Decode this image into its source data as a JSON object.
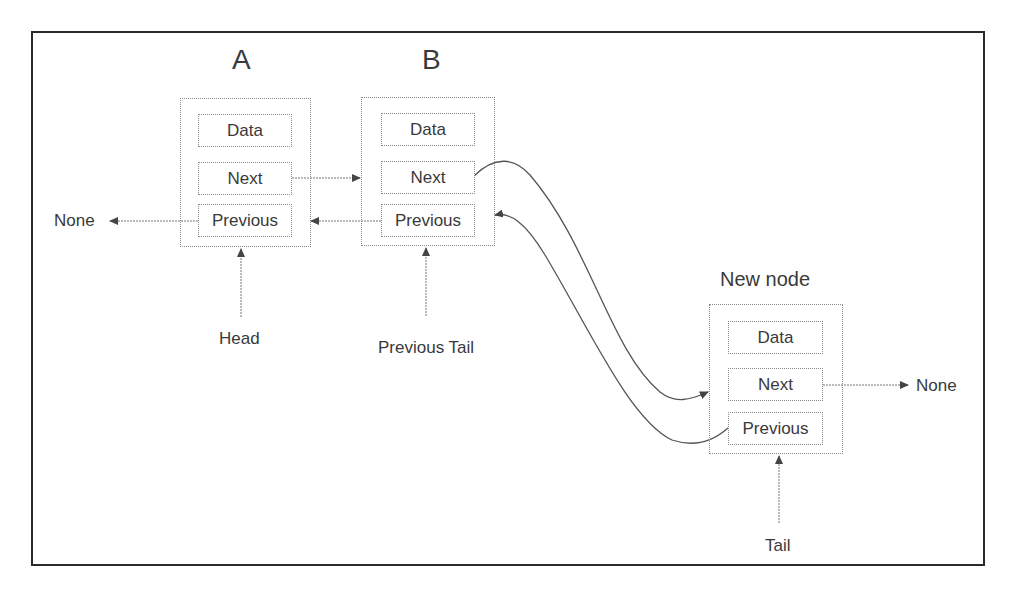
{
  "diagram": {
    "nodes": [
      {
        "id": "A",
        "title": "A",
        "fields": [
          "Data",
          "Next",
          "Previous"
        ]
      },
      {
        "id": "B",
        "title": "B",
        "fields": [
          "Data",
          "Next",
          "Previous"
        ]
      },
      {
        "id": "new",
        "title": "New node",
        "fields": [
          "Data",
          "Next",
          "Previous"
        ]
      }
    ],
    "pointers": {
      "head": "Head",
      "previous_tail": "Previous Tail",
      "tail": "Tail"
    },
    "terminals": {
      "left_none": "None",
      "right_none": "None"
    },
    "edges": [
      {
        "from": "A.Next",
        "to": "B"
      },
      {
        "from": "B.Previous",
        "to": "A"
      },
      {
        "from": "A.Previous",
        "to": "None"
      },
      {
        "from": "B.Next",
        "to": "New node"
      },
      {
        "from": "New node.Previous",
        "to": "B"
      },
      {
        "from": "New node.Next",
        "to": "None"
      },
      {
        "from": "Head",
        "to": "A"
      },
      {
        "from": "Previous Tail",
        "to": "B"
      },
      {
        "from": "Tail",
        "to": "New node"
      }
    ],
    "colors": {
      "frame": "#2a2a2a",
      "box_border": "#8a8a8a",
      "arrow": "#555555",
      "text": "#3a3a3a"
    }
  }
}
